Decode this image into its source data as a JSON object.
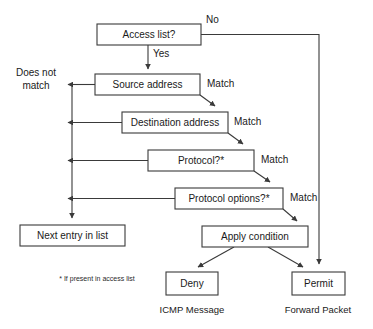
{
  "diagram": {
    "type": "flowchart",
    "colors": {
      "background": "#ffffff",
      "stroke": "#3a3a3a",
      "text": "#1a1a1a"
    },
    "nodes": [
      {
        "id": "access_list",
        "label": "Access list?",
        "x": 97,
        "y": 24,
        "w": 104,
        "h": 21
      },
      {
        "id": "source_address",
        "label": "Source address",
        "x": 95,
        "y": 74,
        "w": 105,
        "h": 21
      },
      {
        "id": "dest_address",
        "label": "Destination address",
        "x": 122,
        "y": 112,
        "w": 106,
        "h": 21
      },
      {
        "id": "protocol",
        "label": "Protocol?*",
        "x": 148,
        "y": 150,
        "w": 106,
        "h": 21
      },
      {
        "id": "protocol_options",
        "label": "Protocol options?*",
        "x": 175,
        "y": 188,
        "w": 108,
        "h": 21
      },
      {
        "id": "next_entry",
        "label": "Next entry in list",
        "x": 20,
        "y": 225,
        "w": 105,
        "h": 21
      },
      {
        "id": "apply_condition",
        "label": "Apply condition",
        "x": 202,
        "y": 226,
        "w": 106,
        "h": 21
      },
      {
        "id": "deny",
        "label": "Deny",
        "x": 166,
        "y": 272,
        "w": 52,
        "h": 23
      },
      {
        "id": "permit",
        "label": "Permit",
        "x": 292,
        "y": 272,
        "w": 53,
        "h": 23
      }
    ],
    "edge_labels": [
      {
        "id": "no",
        "text": "No",
        "x": 206,
        "y": 20
      },
      {
        "id": "yes",
        "text": "Yes",
        "x": 153,
        "y": 54
      },
      {
        "id": "does_not_match",
        "text_line1": "Does not",
        "text_line2": "match",
        "x": 36,
        "y": 78
      },
      {
        "id": "match_source",
        "text": "Match",
        "x": 207,
        "y": 84
      },
      {
        "id": "match_dest",
        "text": "Match",
        "x": 234,
        "y": 122
      },
      {
        "id": "match_protocol",
        "text": "Match",
        "x": 261,
        "y": 160
      },
      {
        "id": "match_options",
        "text": "Match",
        "x": 290,
        "y": 198
      }
    ],
    "outcome_labels": [
      {
        "id": "icmp_message",
        "text": "ICMP Message",
        "x": 192,
        "y": 310
      },
      {
        "id": "forward_packet",
        "text": "Forward Packet",
        "x": 318,
        "y": 310
      }
    ],
    "footnote": {
      "text": "* If present in access list",
      "x": 97,
      "y": 279
    }
  }
}
